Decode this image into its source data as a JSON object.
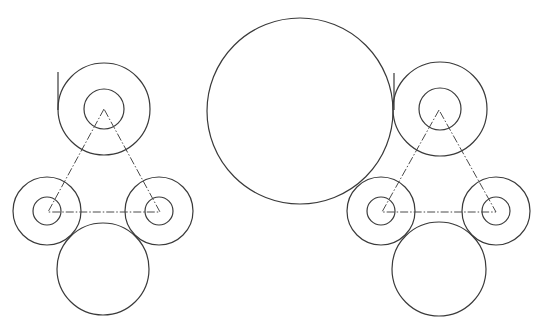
{
  "drawing": {
    "background": "#ffffff",
    "line_color": "#3a3a3a",
    "centerline_color": "#4a4a4a",
    "large_circle": {
      "cx": 300,
      "cy": 111,
      "r": 93
    },
    "assemblies": [
      {
        "name": "left-assembly",
        "top": {
          "cx": 104,
          "cy": 109,
          "r_outer": 46,
          "r_inner": 20
        },
        "bottom_left": {
          "cx": 47,
          "cy": 211,
          "r_outer": 34,
          "r_inner": 14
        },
        "bottom_right": {
          "cx": 159,
          "cy": 211,
          "r_outer": 34,
          "r_inner": 14
        },
        "lower_circle": {
          "cx": 103,
          "cy": 269,
          "r": 46
        },
        "triangle": [
          [
            104,
            109
          ],
          [
            48,
            212
          ],
          [
            160,
            212
          ]
        ],
        "tangent_line": {
          "x": 58,
          "y1": 72,
          "y2": 110
        }
      },
      {
        "name": "right-assembly",
        "top": {
          "cx": 440,
          "cy": 109,
          "r_outer": 47,
          "r_inner": 21
        },
        "bottom_left": {
          "cx": 381,
          "cy": 211,
          "r_outer": 34,
          "r_inner": 14
        },
        "bottom_right": {
          "cx": 496,
          "cy": 211,
          "r_outer": 34,
          "r_inner": 14
        },
        "lower_circle": {
          "cx": 439,
          "cy": 269,
          "r": 47
        },
        "triangle": [
          [
            439,
            110
          ],
          [
            382,
            212
          ],
          [
            496,
            212
          ]
        ],
        "tangent_line": {
          "x": 394,
          "y1": 73,
          "y2": 110
        }
      }
    ]
  }
}
